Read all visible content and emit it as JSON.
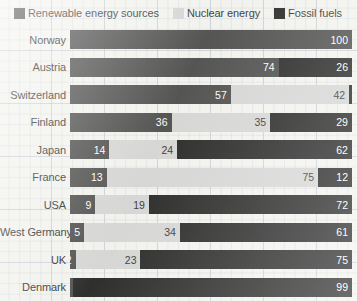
{
  "legend": {
    "items": [
      {
        "label": "Renewable energy sources",
        "key": "renewable",
        "color": "#3a3a3a"
      },
      {
        "label": "Nuclear energy",
        "key": "nuclear",
        "color": "#d2d2d2"
      },
      {
        "label": "Fossil fuels",
        "key": "fossil",
        "color": "#0d0d0d"
      }
    ]
  },
  "chart_data": {
    "type": "bar",
    "subtype": "stacked-horizontal-100pct",
    "title": "",
    "xlabel": "",
    "ylabel": "",
    "xlim": [
      0,
      100
    ],
    "grid": true,
    "legend_position": "top",
    "categories": [
      "Norway",
      "Austria",
      "Switzerland",
      "Finland",
      "Japan",
      "France",
      "USA",
      "West Germany",
      "UK",
      "Denmark"
    ],
    "series": [
      {
        "name": "Renewable energy sources",
        "color": "#3a3a3a",
        "values": [
          100,
          74,
          57,
          36,
          14,
          13,
          9,
          5,
          2,
          1
        ]
      },
      {
        "name": "Nuclear energy",
        "color": "#d2d2d2",
        "values": [
          0,
          0,
          42,
          35,
          24,
          75,
          19,
          34,
          23,
          0
        ]
      },
      {
        "name": "Fossil fuels",
        "color": "#0d0d0d",
        "values": [
          0,
          26,
          1,
          29,
          62,
          12,
          72,
          61,
          75,
          99
        ]
      }
    ],
    "rows": [
      {
        "category": "Norway",
        "segments": [
          {
            "key": "renewable",
            "value": 100,
            "label": "100"
          }
        ]
      },
      {
        "category": "Austria",
        "segments": [
          {
            "key": "renewable",
            "value": 74,
            "label": "74"
          },
          {
            "key": "fossil",
            "value": 26,
            "label": "26"
          }
        ]
      },
      {
        "category": "Switzerland",
        "segments": [
          {
            "key": "renewable",
            "value": 57,
            "label": "57"
          },
          {
            "key": "nuclear",
            "value": 42,
            "label": "42"
          },
          {
            "key": "fossil",
            "value": 1,
            "label": "1"
          }
        ]
      },
      {
        "category": "Finland",
        "segments": [
          {
            "key": "renewable",
            "value": 36,
            "label": "36"
          },
          {
            "key": "nuclear",
            "value": 35,
            "label": "35"
          },
          {
            "key": "fossil",
            "value": 29,
            "label": "29"
          }
        ]
      },
      {
        "category": "Japan",
        "segments": [
          {
            "key": "renewable",
            "value": 14,
            "label": "14"
          },
          {
            "key": "nuclear",
            "value": 24,
            "label": "24"
          },
          {
            "key": "fossil",
            "value": 62,
            "label": "62"
          }
        ]
      },
      {
        "category": "France",
        "segments": [
          {
            "key": "renewable",
            "value": 13,
            "label": "13"
          },
          {
            "key": "nuclear",
            "value": 75,
            "label": "75"
          },
          {
            "key": "fossil",
            "value": 12,
            "label": "12"
          }
        ]
      },
      {
        "category": "USA",
        "segments": [
          {
            "key": "renewable",
            "value": 9,
            "label": "9"
          },
          {
            "key": "nuclear",
            "value": 19,
            "label": "19"
          },
          {
            "key": "fossil",
            "value": 72,
            "label": "72"
          }
        ]
      },
      {
        "category": "West Germany",
        "segments": [
          {
            "key": "renewable",
            "value": 5,
            "label": "5"
          },
          {
            "key": "nuclear",
            "value": 34,
            "label": "34"
          },
          {
            "key": "fossil",
            "value": 61,
            "label": "61"
          }
        ]
      },
      {
        "category": "UK",
        "segments": [
          {
            "key": "renewable",
            "value": 2,
            "label": "2"
          },
          {
            "key": "nuclear",
            "value": 23,
            "label": "23"
          },
          {
            "key": "fossil",
            "value": 75,
            "label": "75"
          }
        ]
      },
      {
        "category": "Denmark",
        "segments": [
          {
            "key": "renewable",
            "value": 1,
            "label": "1"
          },
          {
            "key": "fossil",
            "value": 99,
            "label": "99"
          }
        ]
      }
    ]
  }
}
